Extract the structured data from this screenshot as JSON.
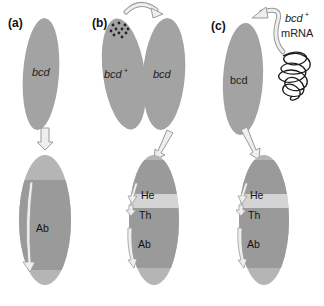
{
  "panels": [
    {
      "label": "(a)",
      "top_embryo": {
        "label": "bcd",
        "italic": true
      },
      "bottom_embryo": {
        "regions": [
          {
            "label": "Ab"
          }
        ]
      }
    },
    {
      "label": "(b)",
      "donor_embryo": {
        "label": "bcd",
        "superscript": "+"
      },
      "top_embryo": {
        "label": "bcd",
        "italic": true
      },
      "bottom_embryo": {
        "regions": [
          {
            "label": "He"
          },
          {
            "label": "Th"
          },
          {
            "label": "Ab"
          }
        ]
      }
    },
    {
      "label": "(c)",
      "injected_material": {
        "label": "bcd",
        "superscript": "+",
        "line2": "mRNA"
      },
      "top_embryo": {
        "label": "bcd",
        "italic": false
      },
      "bottom_embryo": {
        "regions": [
          {
            "label": "He"
          },
          {
            "label": "Th"
          },
          {
            "label": "Ab"
          }
        ]
      }
    }
  ],
  "colors": {
    "embryo_fill": "#a3a3a3",
    "embryo_bottom_fill": "#9a9a9a",
    "embryo_bottom_tip": "#b5b5b5",
    "thorax_band": "#d4d4d4",
    "arrow_fill": "#eeeeee",
    "arrow_stroke": "#9a9a9a",
    "dots": "#222222",
    "mrna_strand": "#1a1a1a"
  }
}
